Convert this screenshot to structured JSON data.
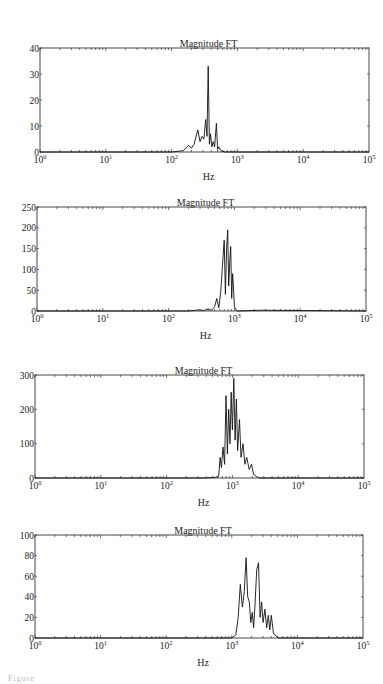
{
  "chart_data": [
    {
      "type": "line",
      "title": "Magnitude FT",
      "xlabel": "Hz",
      "ylabel": "",
      "xscale": "log",
      "xlim": [
        1,
        100000
      ],
      "ylim": [
        0,
        40
      ],
      "yticks": [
        0,
        10,
        20,
        30,
        40
      ],
      "xtick_labels": [
        "10^0",
        "10^1",
        "10^2",
        "10^3",
        "10^4",
        "10^5"
      ],
      "grid": false,
      "legend": null,
      "x": [
        100,
        150,
        180,
        200,
        220,
        250,
        270,
        290,
        310,
        330,
        345,
        360,
        375,
        390,
        410,
        430,
        450,
        480,
        500,
        520,
        560,
        650,
        1000
      ],
      "values": [
        0,
        0.5,
        2.5,
        1.5,
        3,
        8.5,
        4,
        6,
        5,
        12.5,
        6,
        33,
        3,
        7,
        2,
        4,
        2,
        11,
        1,
        2,
        0.5,
        0,
        0
      ],
      "peak": {
        "x": 360,
        "y": 33
      }
    },
    {
      "type": "line",
      "title": "Magnitude FT",
      "xlabel": "Hz",
      "ylabel": "",
      "xscale": "log",
      "xlim": [
        1,
        100000
      ],
      "ylim": [
        0,
        250
      ],
      "yticks": [
        0,
        50,
        100,
        150,
        200,
        250
      ],
      "xtick_labels": [
        "10^0",
        "10^1",
        "10^2",
        "10^3",
        "10^4",
        "10^5"
      ],
      "grid": false,
      "legend": null,
      "x": [
        200,
        300,
        340,
        400,
        450,
        500,
        540,
        580,
        620,
        660,
        700,
        730,
        760,
        790,
        820,
        850,
        880,
        910,
        940,
        970,
        1000,
        1100,
        2500
      ],
      "values": [
        0,
        3,
        1,
        5,
        2,
        10,
        30,
        8,
        45,
        110,
        170,
        40,
        150,
        195,
        60,
        120,
        155,
        30,
        90,
        55,
        10,
        0,
        2
      ],
      "peak": {
        "x": 790,
        "y": 195
      }
    },
    {
      "type": "line",
      "title": "Magnitude FT",
      "xlabel": "Hz",
      "ylabel": "",
      "xscale": "log",
      "xlim": [
        1,
        100000
      ],
      "ylim": [
        0,
        300
      ],
      "yticks": [
        0,
        100,
        200,
        300
      ],
      "xtick_labels": [
        "10^0",
        "10^1",
        "10^2",
        "10^3",
        "10^4",
        "10^5"
      ],
      "grid": false,
      "legend": null,
      "x": [
        400,
        550,
        620,
        650,
        680,
        720,
        760,
        800,
        840,
        880,
        920,
        960,
        1000,
        1050,
        1100,
        1150,
        1200,
        1280,
        1350,
        1450,
        1550,
        1650,
        1800,
        1950,
        2100,
        2300,
        2600
      ],
      "values": [
        0,
        2,
        5,
        60,
        30,
        90,
        40,
        240,
        70,
        200,
        100,
        250,
        140,
        290,
        110,
        230,
        80,
        170,
        60,
        100,
        40,
        60,
        25,
        40,
        10,
        5,
        0
      ],
      "peak": {
        "x": 1050,
        "y": 290
      }
    },
    {
      "type": "line",
      "title": "Magnitude FT",
      "xlabel": "Hz",
      "ylabel": "",
      "xscale": "log",
      "xlim": [
        1,
        100000
      ],
      "ylim": [
        0,
        100
      ],
      "yticks": [
        0,
        20,
        40,
        60,
        80,
        100
      ],
      "xtick_labels": [
        "10^0",
        "10^1",
        "10^2",
        "10^3",
        "10^4",
        "10^5"
      ],
      "grid": false,
      "legend": null,
      "x": [
        1000,
        1150,
        1250,
        1350,
        1450,
        1550,
        1650,
        1750,
        1850,
        1950,
        2050,
        2150,
        2250,
        2400,
        2550,
        2700,
        2850,
        3000,
        3200,
        3400,
        3600,
        3800,
        4000,
        4300,
        4700,
        5200
      ],
      "values": [
        0,
        3,
        20,
        52,
        30,
        45,
        78,
        40,
        35,
        15,
        25,
        10,
        30,
        66,
        73,
        20,
        35,
        15,
        28,
        10,
        22,
        8,
        22,
        5,
        2,
        0
      ],
      "peak": {
        "x": 1650,
        "y": 78
      }
    }
  ],
  "panels": [
    {
      "title": "Magnitude FT",
      "xlabel": "Hz",
      "ytick_labels": [
        "0",
        "10",
        "20",
        "30",
        "40"
      ]
    },
    {
      "title": "Magnitude FT",
      "xlabel": "Hz",
      "ytick_labels": [
        "0",
        "50",
        "100",
        "150",
        "200",
        "250"
      ]
    },
    {
      "title": "Magnitude FT",
      "xlabel": "Hz",
      "ytick_labels": [
        "0",
        "100",
        "200",
        "300"
      ]
    },
    {
      "title": "Magnitude FT",
      "xlabel": "Hz",
      "ytick_labels": [
        "0",
        "20",
        "40",
        "60",
        "80",
        "100"
      ]
    }
  ],
  "xtick_base": "10",
  "xtick_exponents": [
    "0",
    "1",
    "2",
    "3",
    "4",
    "5"
  ],
  "caption": "Figure"
}
